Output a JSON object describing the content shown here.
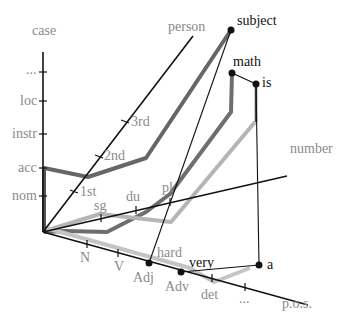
{
  "axes": {
    "case": {
      "label": "case",
      "ticks": [
        "nom",
        "acc",
        "instr",
        "loc",
        "..."
      ]
    },
    "person": {
      "label": "person",
      "ticks": [
        "1st",
        "2nd",
        "3rd"
      ]
    },
    "number": {
      "label": "number",
      "ticks": [
        "sg",
        "du",
        "pl"
      ]
    },
    "pos": {
      "label": "p.o.s.",
      "ticks": [
        "N",
        "V",
        "Adj",
        "Adv",
        "det",
        "..."
      ]
    }
  },
  "words": [
    {
      "label": "subject"
    },
    {
      "label": "math"
    },
    {
      "label": "is"
    },
    {
      "label": "hard"
    },
    {
      "label": "very"
    },
    {
      "label": "a"
    }
  ],
  "colors": {
    "axis": "#111111",
    "path_dark": "#555555",
    "path_mid": "#7a7a7a",
    "path_light": "#bdbdbd",
    "label_gray": "#8a8a8a"
  }
}
